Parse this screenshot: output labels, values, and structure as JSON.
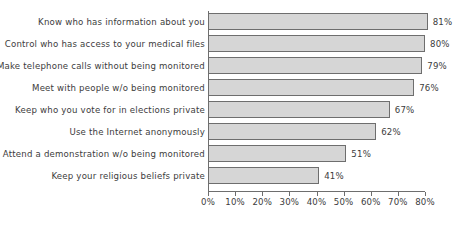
{
  "chart_data": {
    "type": "bar",
    "orientation": "horizontal",
    "title": "",
    "subtitle": "",
    "xlabel": "",
    "ylabel": "",
    "xlim": [
      0,
      80
    ],
    "grid": false,
    "legend": null,
    "value_label_suffix": "%",
    "xticks": [
      {
        "value": 0,
        "label": "0%"
      },
      {
        "value": 10,
        "label": "10%"
      },
      {
        "value": 20,
        "label": "20%"
      },
      {
        "value": 30,
        "label": "30%"
      },
      {
        "value": 40,
        "label": "40%"
      },
      {
        "value": 50,
        "label": "50%"
      },
      {
        "value": 60,
        "label": "60%"
      },
      {
        "value": 70,
        "label": "70%"
      },
      {
        "value": 80,
        "label": "80%"
      }
    ],
    "categories": [
      "Know who has information about you",
      "Control who has access to your medical files",
      "Make telephone calls without being monitored",
      "Meet with people w/o being monitored",
      "Keep who you vote for in elections private",
      "Use the Internet anonymously",
      "Attend a demonstration w/o being monitored",
      "Keep your religious beliefs private"
    ],
    "values": [
      81,
      80,
      79,
      76,
      67,
      62,
      51,
      41
    ],
    "data_labels": [
      "81%",
      "80%",
      "79%",
      "76%",
      "67%",
      "62%",
      "51%",
      "41%"
    ],
    "bars": [
      {
        "category": "Know who has information about you",
        "value": 81,
        "label": "81%"
      },
      {
        "category": "Control who has access to your medical files",
        "value": 80,
        "label": "80%"
      },
      {
        "category": "Make telephone calls without being monitored",
        "value": 79,
        "label": "79%"
      },
      {
        "category": "Meet with people w/o being monitored",
        "value": 76,
        "label": "76%"
      },
      {
        "category": "Keep who you vote for in elections private",
        "value": 67,
        "label": "67%"
      },
      {
        "category": "Use the Internet anonymously",
        "value": 62,
        "label": "62%"
      },
      {
        "category": "Attend a demonstration w/o being monitored",
        "value": 51,
        "label": "51%"
      },
      {
        "category": "Keep your religious beliefs private",
        "value": 41,
        "label": "41%"
      }
    ],
    "colors": {
      "bar_fill": "#d6d6d6",
      "bar_border": "#6e6e6e",
      "axis": "#6e6e6e",
      "text": "#3c3c3c",
      "background": "#ffffff"
    }
  }
}
